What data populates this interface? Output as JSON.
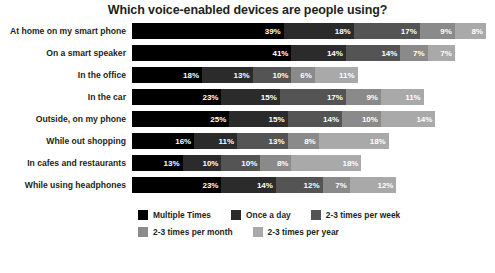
{
  "chart_data": {
    "type": "bar",
    "title": "Which voice-enabled devices are people using?",
    "xlabel": "",
    "ylabel": "",
    "orientation": "horizontal",
    "stacked": true,
    "grid": false,
    "legend_position": "bottom",
    "xlim": [
      0,
      91
    ],
    "value_suffix": "%",
    "categories": [
      "At home on my smart phone",
      "On a smart speaker",
      "In the office",
      "In the car",
      "Outside, on my phone",
      "While out shopping",
      "In cafes and restaurants",
      "While using headphones"
    ],
    "series": [
      {
        "name": "Multiple Times",
        "color": "#000000",
        "values": [
          39,
          41,
          18,
          23,
          25,
          16,
          13,
          23
        ]
      },
      {
        "name": "Once a day",
        "color": "#2b2b2b",
        "values": [
          18,
          14,
          13,
          15,
          15,
          11,
          10,
          14
        ]
      },
      {
        "name": "2-3 times per week",
        "color": "#545454",
        "values": [
          17,
          14,
          10,
          17,
          14,
          13,
          10,
          12
        ]
      },
      {
        "name": "2-3 times per month",
        "color": "#8a8a8a",
        "values": [
          9,
          7,
          6,
          9,
          10,
          8,
          8,
          7
        ]
      },
      {
        "name": "2-3 times per year",
        "color": "#a9a9a9",
        "values": [
          8,
          7,
          11,
          11,
          14,
          18,
          18,
          12
        ]
      }
    ],
    "row_totals": [
      91,
      83,
      58,
      75,
      78,
      66,
      59,
      68
    ]
  }
}
